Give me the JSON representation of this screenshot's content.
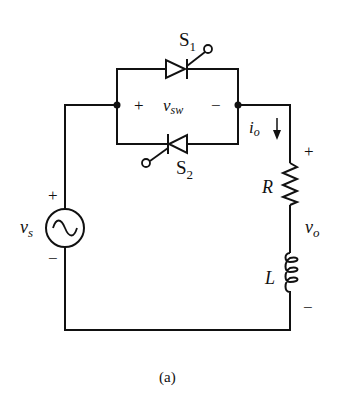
{
  "figure": {
    "caption": "(a)",
    "colors": {
      "ink": "#111111",
      "background": "#ffffff"
    }
  },
  "components": {
    "source": {
      "symbol": "v",
      "sub": "s",
      "plus": "+",
      "minus": "−",
      "icon": "ac-source-icon"
    },
    "switch1": {
      "symbol": "S",
      "sub": "1",
      "icon": "scr-thyristor-icon"
    },
    "switch2": {
      "symbol": "S",
      "sub": "2",
      "icon": "scr-thyristor-icon"
    },
    "switch_voltage": {
      "symbol": "v",
      "sub": "sw",
      "plus": "+",
      "minus": "−"
    },
    "output_current": {
      "symbol": "i",
      "sub": "o",
      "icon": "arrow-down-icon"
    },
    "resistor": {
      "symbol": "R",
      "icon": "resistor-icon"
    },
    "inductor": {
      "symbol": "L",
      "icon": "inductor-icon"
    },
    "output_voltage": {
      "symbol": "v",
      "sub": "o",
      "plus": "+",
      "minus": "−"
    }
  }
}
